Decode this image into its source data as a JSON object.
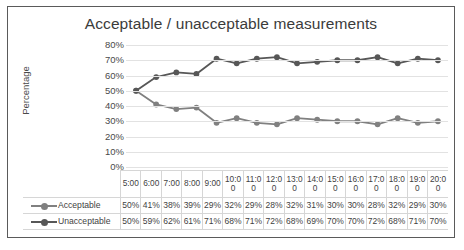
{
  "chart_data": {
    "type": "line",
    "title": "Acceptable / unacceptable measurements",
    "xlabel": "",
    "ylabel": "Percentage",
    "ylim": [
      0,
      80
    ],
    "grid": true,
    "legend_position": "bottom-left-table",
    "categories": [
      "5:00",
      "6:00",
      "7:00",
      "8:00",
      "9:00",
      "10:00",
      "11:00",
      "12:00",
      "13:00",
      "14:00",
      "15:00",
      "16:00",
      "17:00",
      "18:00",
      "19:00",
      "20:00"
    ],
    "ytick_labels": [
      "80%",
      "70%",
      "60%",
      "50%",
      "40%",
      "30%",
      "20%",
      "10%",
      "0%"
    ],
    "ytick_values": [
      80,
      70,
      60,
      50,
      40,
      30,
      20,
      10,
      0
    ],
    "series": [
      {
        "name": "Acceptable",
        "color": "#808080",
        "values": [
          50,
          41,
          38,
          39,
          29,
          32,
          29,
          28,
          32,
          31,
          30,
          30,
          28,
          32,
          29,
          30
        ],
        "labels": [
          "50%",
          "41%",
          "38%",
          "39%",
          "29%",
          "32%",
          "29%",
          "28%",
          "32%",
          "31%",
          "30%",
          "30%",
          "28%",
          "32%",
          "29%",
          "30%"
        ]
      },
      {
        "name": "Unacceptable",
        "color": "#575757",
        "values": [
          50,
          59,
          62,
          61,
          71,
          68,
          71,
          72,
          68,
          69,
          70,
          70,
          72,
          68,
          71,
          70
        ],
        "labels": [
          "50%",
          "59%",
          "62%",
          "61%",
          "71%",
          "68%",
          "71%",
          "72%",
          "68%",
          "69%",
          "70%",
          "70%",
          "72%",
          "68%",
          "71%",
          "70%"
        ]
      }
    ]
  },
  "colors": {
    "frame_border": "#5a5a5a",
    "gridline": "#e2e2e2",
    "table_border": "#d6d6d6",
    "text": "#3f3f3f",
    "title_text": "#3b3b3b"
  }
}
